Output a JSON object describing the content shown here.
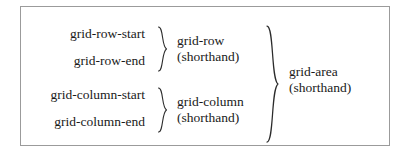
{
  "diagram": {
    "type": "css-grid-placement-shorthand-tree",
    "border_color": "#9b9b9b",
    "text_color": "#1a1a1a",
    "brace_color": "#2b2b2b",
    "background": "#ffffff",
    "longhand_properties": [
      {
        "label": "grid-row-start"
      },
      {
        "label": "grid-row-end"
      },
      {
        "label": "grid-column-start"
      },
      {
        "label": "grid-column-end"
      }
    ],
    "shorthands": [
      {
        "name": "grid-row",
        "qualifier": "(shorthand)",
        "groups": [
          "grid-row-start",
          "grid-row-end"
        ]
      },
      {
        "name": "grid-column",
        "qualifier": "(shorthand)",
        "groups": [
          "grid-column-start",
          "grid-column-end"
        ]
      }
    ],
    "top_shorthand": {
      "name": "grid-area",
      "qualifier": "(shorthand)",
      "groups": [
        "grid-row",
        "grid-column"
      ]
    },
    "braces": [
      {
        "name": "brace-grid-row"
      },
      {
        "name": "brace-grid-column"
      },
      {
        "name": "brace-grid-area"
      }
    ]
  }
}
